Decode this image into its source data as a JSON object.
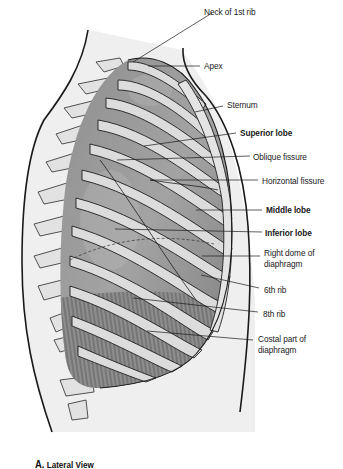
{
  "figure": {
    "caption_letter": "A.",
    "caption_text": "Lateral View",
    "labels": [
      {
        "id": "neck-of-1st-rib",
        "text": "Neck of 1st rib",
        "bold": false
      },
      {
        "id": "apex",
        "text": "Apex",
        "bold": false
      },
      {
        "id": "sternum",
        "text": "Sternum",
        "bold": false
      },
      {
        "id": "superior-lobe",
        "text": "Superior lobe",
        "bold": true
      },
      {
        "id": "oblique-fissure",
        "text": "Oblique fissure",
        "bold": false
      },
      {
        "id": "horizontal-fissure",
        "text": "Horizontal fissure",
        "bold": false
      },
      {
        "id": "middle-lobe",
        "text": "Middle lobe",
        "bold": true
      },
      {
        "id": "inferior-lobe",
        "text": "Inferior lobe",
        "bold": true
      },
      {
        "id": "right-dome-of-diaphragm",
        "text": "Right dome of",
        "text2": "diaphragm",
        "bold": false
      },
      {
        "id": "6th-rib",
        "text": "6th rib",
        "bold": false
      },
      {
        "id": "8th-rib",
        "text": "8th rib",
        "bold": false
      },
      {
        "id": "costal-part-of-diaphragm",
        "text": "Costal part of",
        "text2": "diaphragm",
        "bold": false
      }
    ]
  },
  "colors": {
    "outline": "#1a1a1a",
    "lung_dark": "#7a7a7a",
    "lung_mid": "#9a9a9a",
    "rib_fill": "#dedede",
    "skin_fill": "#eeeeee",
    "background": "#ffffff"
  }
}
